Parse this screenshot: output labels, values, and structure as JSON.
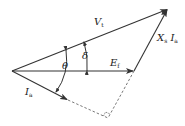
{
  "diagram": {
    "labels": {
      "vt_main": "V",
      "vt_sub": "t",
      "ef_main": "E",
      "ef_sub": "f",
      "ia_main": "I",
      "ia_sub": "a",
      "xs_main": "X",
      "xs_sub": "s",
      "xs_i_main": "I",
      "xs_i_sub": "a",
      "theta": "θ",
      "delta": "δ"
    },
    "colors": {
      "line": "#333333",
      "text": "#222222",
      "background": "#ffffff"
    },
    "points": {
      "origin": [
        12,
        71
      ],
      "vt_tip": [
        168,
        9
      ],
      "ef_tip": [
        134,
        71
      ],
      "ia_tip": [
        68,
        100
      ],
      "right_angle": [
        108,
        118
      ]
    }
  }
}
